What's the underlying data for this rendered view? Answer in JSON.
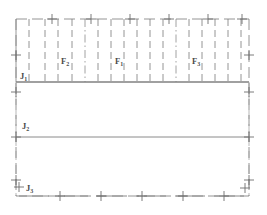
{
  "figure": {
    "type": "line-diagram",
    "width": 267,
    "height": 215,
    "background_color": "#ffffff",
    "line_color": "#6e6e6e",
    "solid_line_color": "#808080",
    "text_color": "#4a4a4a"
  },
  "labels": {
    "j1": {
      "text": "J",
      "sub": "1",
      "x": 20,
      "y": 76
    },
    "j2": {
      "text": "J",
      "sub": "2",
      "x": 22,
      "y": 122
    },
    "j3": {
      "text": "J",
      "sub": "3",
      "x": 23,
      "y": 183
    },
    "f1": {
      "text": "F",
      "sub": "1",
      "x": 115,
      "y": 58
    },
    "f2": {
      "text": "F",
      "sub": "2",
      "x": 61,
      "y": 58
    },
    "f3": {
      "text": "F",
      "sub": "3",
      "x": 191,
      "y": 58
    }
  },
  "geometry": {
    "frame": {
      "left": 16,
      "right": 249,
      "top": 19,
      "bottom": 196
    },
    "horizontal_solid_lines": [
      {
        "name": "J1-line",
        "y": 82,
        "x1": 16,
        "x2": 249
      },
      {
        "name": "J2-line",
        "y": 137,
        "x1": 16,
        "x2": 249
      }
    ],
    "vertical_dashed_lines_x": [
      29,
      45,
      58,
      72,
      85,
      98,
      111,
      124,
      137,
      150,
      163,
      176,
      189,
      202,
      215,
      228,
      241
    ],
    "vertical_dashdot_lines_x": [
      85,
      176
    ],
    "top_plus_markers_x": [
      52,
      91,
      130,
      169,
      208,
      242
    ],
    "bottom_plus_markers_x": [
      19,
      60,
      101,
      142,
      183,
      224,
      245
    ],
    "left_plus_markers_y": [
      55,
      92,
      137,
      180
    ],
    "right_plus_markers_y": [
      20,
      55,
      92,
      137,
      180,
      196
    ]
  },
  "legend": {
    "joint_sets": [
      "J1",
      "J2",
      "J3"
    ],
    "fault_sets": [
      "F1",
      "F2",
      "F3"
    ]
  }
}
